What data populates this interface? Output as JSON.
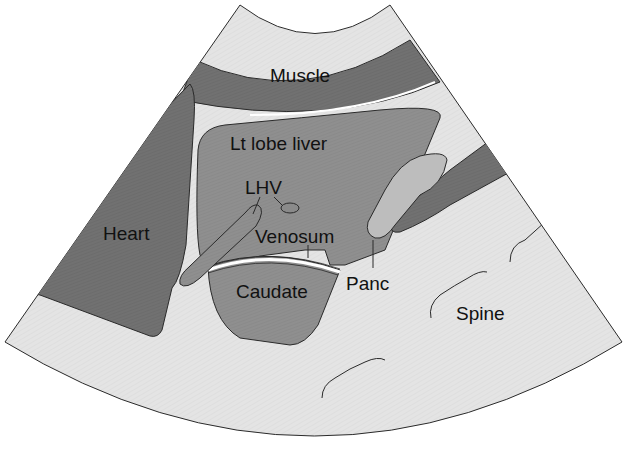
{
  "figure": {
    "type": "ultrasound sector scan schematic",
    "labels": {
      "muscle": "Muscle",
      "lt_lobe_liver": "Lt lobe liver",
      "lhv": "LHV",
      "heart": "Heart",
      "venosum": "Venosum",
      "caudate": "Caudate",
      "panc": "Panc",
      "spine": "Spine"
    },
    "colors": {
      "background": "#ffffff",
      "sector_fill": "#e6e6e6",
      "muscle": "#7d7d7d",
      "heart": "#6f6f6f",
      "liver": "#8e8e8e",
      "vessel": "#8a8a8a",
      "pancreas": "#bdbdbd",
      "dark_duct": "#767676",
      "outline": "#2a2a2a"
    }
  }
}
